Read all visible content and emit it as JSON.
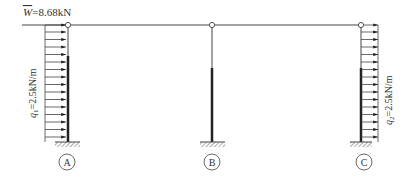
{
  "diagram": {
    "type": "structural-frame",
    "colors": {
      "line": "#444444",
      "thick": "#222222",
      "text": "#333333"
    },
    "load_w": {
      "symbol": "W",
      "value": "=8.68kN"
    },
    "load_q1": {
      "symbol": "q",
      "sub": "1",
      "value": "=2.5kN/m"
    },
    "load_q2": {
      "symbol": "q",
      "sub": "2",
      "value": "=2.5kN/m"
    },
    "supports": [
      {
        "label": "A"
      },
      {
        "label": "B"
      },
      {
        "label": "C"
      }
    ]
  }
}
